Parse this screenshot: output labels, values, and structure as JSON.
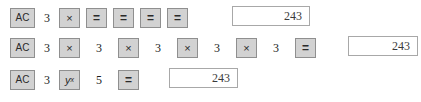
{
  "sequences": {
    "row1": {
      "clear_label": "AC",
      "operand": "3",
      "multiply_label": "×",
      "equals_label": "=",
      "equals_presses": 4,
      "display_value": "243"
    },
    "row2": {
      "clear_label": "AC",
      "operand": "3",
      "multiply_label": "×",
      "equals_label": "=",
      "operands": [
        "3",
        "3",
        "3",
        "3",
        "3"
      ],
      "multiply_presses": 4,
      "display_value": "243"
    },
    "row3": {
      "clear_label": "AC",
      "base": "3",
      "power_label": "y",
      "power_exponent": "x",
      "exponent": "5",
      "equals_label": "=",
      "display_value": "243"
    }
  },
  "colors": {
    "key_face": "#d2d2d2",
    "key_border": "#8f8f8f",
    "key_text": "#2a2a2a",
    "display_background": "#ffffff",
    "display_border": "#a8a8a8",
    "display_text": "#3a3a3a",
    "page_background": "#ffffff"
  }
}
